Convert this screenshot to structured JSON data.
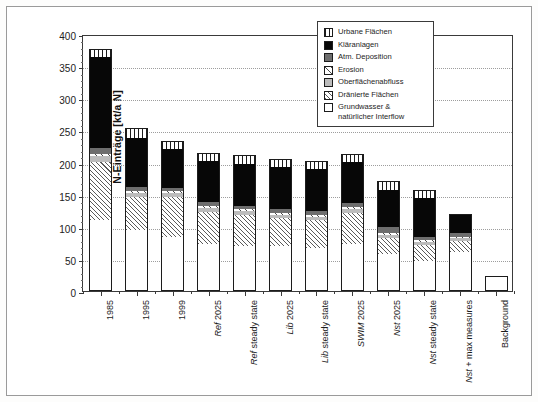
{
  "chart_data": {
    "type": "bar",
    "subtype": "stacked-bar",
    "title": "",
    "xlabel": "",
    "ylabel": "N-Einträge [kt/a N]",
    "ylim": [
      0,
      400
    ],
    "ytick_values": [
      0,
      50,
      100,
      150,
      200,
      250,
      300,
      350,
      400
    ],
    "ytick_labels": [
      "0",
      "50",
      "100",
      "150",
      "200",
      "250",
      "300",
      "350",
      "400"
    ],
    "y_minor_interval": 10,
    "grid": "horizontal-dotted",
    "legend_position": "top-right-inside",
    "categories": [
      "1985",
      "1995",
      "1999",
      "Ref 2025",
      "Ref steady state",
      "Lib 2025",
      "Lib steady state",
      "SWIM 2025",
      "Nst 2025",
      "Nst steady state",
      "Nst + max measures",
      "Background"
    ],
    "category_labels_html": [
      {
        "italic": "",
        "plain": "1985"
      },
      {
        "italic": "",
        "plain": "1995"
      },
      {
        "italic": "",
        "plain": "1999"
      },
      {
        "italic": "Ref",
        "plain": " 2025"
      },
      {
        "italic": "Ref",
        "plain": " steady state"
      },
      {
        "italic": "Lib",
        "plain": " 2025"
      },
      {
        "italic": "Lib",
        "plain": " steady state"
      },
      {
        "italic": "SWIM",
        "plain": " 2025"
      },
      {
        "italic": "Nst",
        "plain": " 2025"
      },
      {
        "italic": "Nst",
        "plain": " steady state"
      },
      {
        "italic": "Nst",
        "plain": " + max measures"
      },
      {
        "italic": "",
        "plain": "Background"
      }
    ],
    "series": [
      {
        "name": "Grundwasser & natürlicher Interflow",
        "pattern": "white",
        "values": [
          110,
          95,
          84,
          73,
          70,
          70,
          67,
          73,
          58,
          46,
          61,
          22
        ]
      },
      {
        "name": "Dränierte Flächen",
        "pattern": "fine-diagonal-hatch",
        "values": [
          91,
          52,
          63,
          50,
          48,
          43,
          43,
          49,
          24,
          26,
          17,
          0
        ]
      },
      {
        "name": "Oberflächenabfluss",
        "pattern": "light-gray-solid",
        "values": [
          9,
          6,
          5,
          6,
          6,
          6,
          5,
          6,
          5,
          4,
          4,
          0
        ]
      },
      {
        "name": "Erosion",
        "pattern": "sparse-diagonal-hatch",
        "values": [
          4,
          3,
          3,
          3,
          3,
          3,
          3,
          3,
          3,
          3,
          2,
          0
        ]
      },
      {
        "name": "Atm. Deposition",
        "pattern": "dark-gray-solid",
        "values": [
          8,
          6,
          5,
          6,
          6,
          6,
          6,
          6,
          9,
          5,
          6,
          2
        ]
      },
      {
        "name": "Kläranlagen",
        "pattern": "black-solid",
        "values": [
          142,
          76,
          61,
          64,
          65,
          65,
          66,
          64,
          59,
          60,
          30,
          0
        ]
      },
      {
        "name": "Urbane Flächen",
        "pattern": "vertical-stripes",
        "values": [
          13,
          15,
          13,
          13,
          13,
          13,
          13,
          13,
          14,
          14,
          0,
          0
        ]
      }
    ],
    "totals": [
      377,
      253,
      234,
      215,
      211,
      206,
      203,
      214,
      172,
      158,
      120,
      24
    ],
    "annotations": []
  },
  "legend": {
    "items": [
      {
        "label": "Urbane Flächen",
        "swatch": "vertical-stripes-swatch"
      },
      {
        "label": "Kläranlagen",
        "swatch": "black-solid-swatch"
      },
      {
        "label": "Atm. Deposition",
        "swatch": "dark-gray-solid-swatch"
      },
      {
        "label": "Erosion",
        "swatch": "sparse-diagonal-hatch-swatch"
      },
      {
        "label": "Oberflächenabfluss",
        "swatch": "light-gray-solid-swatch"
      },
      {
        "label": "Dränierte Flächen",
        "swatch": "fine-diagonal-hatch-swatch"
      },
      {
        "label": "Grundwasser &\nnatürlicher Interflow",
        "swatch": "white-swatch"
      }
    ]
  },
  "colors": {
    "black": "#070707",
    "dark_gray": "#6e6e6e",
    "light_gray": "#bcbcbc",
    "white": "#ffffff",
    "axis": "#3a3a3a",
    "grid": "#9d9d9d",
    "frame": "#9a9a9a"
  }
}
